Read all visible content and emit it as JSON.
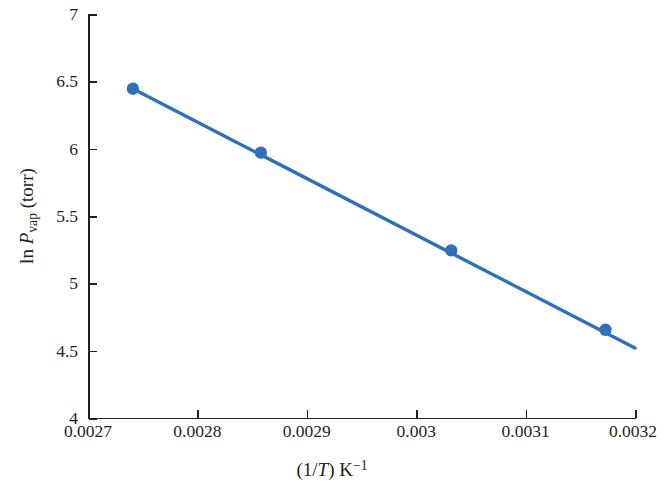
{
  "chart_data": {
    "type": "line",
    "title": "",
    "subtitle": "",
    "xlabel_plain": "(1/T) K^-1",
    "ylabel_plain": "ln P_vap (torr)",
    "xlim": [
      0.0027,
      0.0032
    ],
    "ylim": [
      4,
      7
    ],
    "grid": false,
    "legend": "none",
    "x_ticks": [
      0.0027,
      0.0028,
      0.0029,
      0.003,
      0.0031,
      0.0032
    ],
    "x_tick_labels": [
      "0.0027",
      "0.0028",
      "0.0029",
      "0.003",
      "0.0031",
      "0.0032"
    ],
    "y_ticks": [
      4,
      4.5,
      5,
      5.5,
      6,
      6.5,
      7
    ],
    "y_tick_labels": [
      "4",
      "4.5",
      "5",
      "5.5",
      "6",
      "6.5",
      "7"
    ],
    "series": [
      {
        "name": "ln Pvap vs 1/T",
        "color": "#3070B8",
        "marker": "circle",
        "x": [
          0.002741,
          0.002858,
          0.003032,
          0.003173
        ],
        "y": [
          6.445,
          5.97,
          5.245,
          4.655
        ]
      }
    ],
    "trendline": {
      "name": "linear fit",
      "color": "#3070B8",
      "x": [
        0.002741,
        0.0032
      ],
      "y": [
        6.445,
        4.52
      ]
    }
  },
  "axes": {
    "x_title": {
      "open_paren": "(1/",
      "italic_T": "T",
      "close_paren": ")",
      "space": " ",
      "unit": "K",
      "exponent": "−1"
    },
    "y_title": {
      "ln": "ln ",
      "italic_P": "P",
      "subscript": "vap",
      "unit": " (torr)"
    }
  }
}
